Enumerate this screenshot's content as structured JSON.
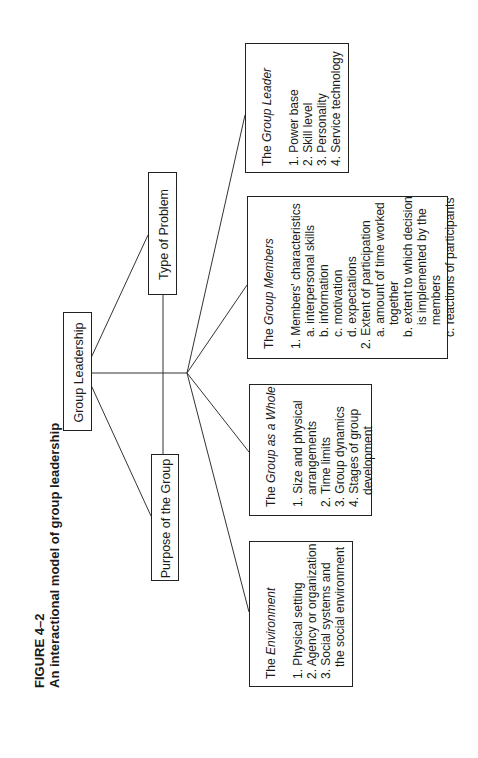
{
  "figure": {
    "number": "FIGURE 4–2",
    "title": "An interactional model of group leadership"
  },
  "nodes": {
    "root": "Group Leadership",
    "type_of_problem": "Type of Problem",
    "purpose": "Purpose of the Group"
  },
  "details": {
    "leader": {
      "title_prefix": "The ",
      "title_italic": "Group Leader",
      "items": [
        {
          "level": 0,
          "text": "1. Power base"
        },
        {
          "level": 0,
          "text": "2. Skill level"
        },
        {
          "level": 0,
          "text": "3. Personality"
        },
        {
          "level": 0,
          "text": "4. Service technology"
        }
      ]
    },
    "members": {
      "title_prefix": "The ",
      "title_italic": "Group Members",
      "items": [
        {
          "level": 0,
          "text": "1. Members' characteristics"
        },
        {
          "level": 1,
          "text": "a. interpersonal skills"
        },
        {
          "level": 1,
          "text": "b. information"
        },
        {
          "level": 1,
          "text": "c. motivation"
        },
        {
          "level": 1,
          "text": "d. expectations"
        },
        {
          "level": 0,
          "text": "2. Extent of participation"
        },
        {
          "level": 1,
          "text": "a. amount of time worked"
        },
        {
          "level": 2,
          "text": "together"
        },
        {
          "level": 1,
          "text": "b. extent to which decision"
        },
        {
          "level": 2,
          "text": "is implemented by the"
        },
        {
          "level": 2,
          "text": "members"
        },
        {
          "level": 1,
          "text": "c. reactions of participants"
        }
      ]
    },
    "whole": {
      "title_prefix": "The ",
      "title_italic": "Group as a Whole",
      "items": [
        {
          "level": 0,
          "text": "1. Size and physical"
        },
        {
          "level": 1,
          "text": "arrangements"
        },
        {
          "level": 0,
          "text": "2. Time limits"
        },
        {
          "level": 0,
          "text": "3. Group dynamics"
        },
        {
          "level": 0,
          "text": "4. Stages of group"
        },
        {
          "level": 1,
          "text": "development"
        }
      ]
    },
    "environment": {
      "title_prefix": "The ",
      "title_italic": "Environment",
      "items": [
        {
          "level": 0,
          "text": "1. Physical setting"
        },
        {
          "level": 0,
          "text": "2. Agency or organization"
        },
        {
          "level": 0,
          "text": "3. Social systems and"
        },
        {
          "level": 1,
          "text": "the social environment"
        }
      ]
    }
  },
  "style": {
    "line_color": "#333333",
    "box_border": "#222222",
    "text_color": "#1a1a1a"
  }
}
